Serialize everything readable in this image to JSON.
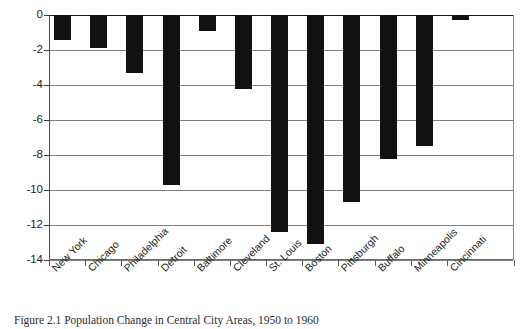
{
  "chart_data": {
    "type": "bar",
    "title": "",
    "subtitle": "",
    "xlabel": "",
    "ylabel": "",
    "orientation": "vertical",
    "grid": true,
    "legend": false,
    "ylim": [
      -14,
      0
    ],
    "yticks": [
      0,
      -2,
      -4,
      -6,
      -8,
      -10,
      -12,
      -14
    ],
    "ytick_labels": [
      "0",
      "-2",
      "-4",
      "-6",
      "-8",
      "-10",
      "-12",
      "-14"
    ],
    "bar_color": "#111111",
    "categories": [
      "New York",
      "Chicago",
      "Philadelphia",
      "Detroit",
      "Baltimore",
      "Cleveland",
      "St. Louis",
      "Boston",
      "Pittsburgh",
      "Buffalo",
      "Minneapolis",
      "Cincinnati"
    ],
    "values": [
      -1.4,
      -1.9,
      -3.3,
      -9.7,
      -0.9,
      -4.2,
      -12.4,
      -13.1,
      -10.7,
      -8.2,
      -7.5,
      -0.3
    ],
    "series": [
      {
        "name": "Population change",
        "values": [
          -1.4,
          -1.9,
          -3.3,
          -9.7,
          -0.9,
          -4.2,
          -12.4,
          -13.1,
          -10.7,
          -8.2,
          -7.5,
          -0.3
        ]
      }
    ]
  },
  "caption": {
    "text": "Figure 2.1  Population Change in Central City Areas, 1950 to 1960"
  },
  "axes": {
    "y_axis_name": "y-axis",
    "x_axis_name": "x-axis"
  }
}
